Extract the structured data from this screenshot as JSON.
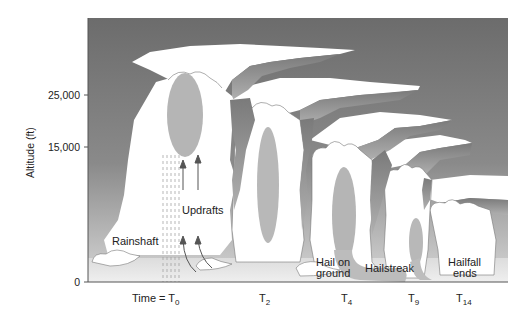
{
  "diagram": {
    "title": "",
    "y_axis": {
      "label": "Altitude (ft)",
      "ticks": [
        {
          "value": "25,000",
          "y": 95
        },
        {
          "value": "15,000",
          "y": 147
        },
        {
          "value": "0",
          "y": 282
        }
      ]
    },
    "x_axis": {
      "time_labels": [
        {
          "prefix": "Time = T",
          "sub": "0",
          "x": 140
        },
        {
          "prefix": "T",
          "sub": "2",
          "x": 258
        },
        {
          "prefix": "T",
          "sub": "4",
          "x": 340
        },
        {
          "prefix": "T",
          "sub": "9",
          "x": 410
        },
        {
          "prefix": "T",
          "sub": "14",
          "x": 457
        }
      ]
    },
    "annotations": {
      "rainshaft": "Rainshaft",
      "updrafts": "Updrafts",
      "hail_on_ground_line1": "Hail on",
      "hail_on_ground_line2": "ground",
      "hailstreak": "Hailstreak",
      "hailfall_ends_line1": "Hailfall",
      "hailfall_ends_line2": "ends"
    },
    "colors": {
      "sky_top": "#6e6e6e",
      "sky_bottom": "#c8c8c8",
      "cloud": "#ffffff",
      "cloud_shadow": "#8a8a8a",
      "hail_core": "#b5b5b5",
      "ground": "#e6e6e6",
      "axis": "#555555"
    }
  }
}
